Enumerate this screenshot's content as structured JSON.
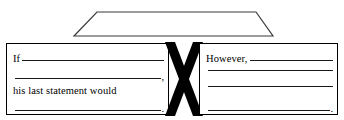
{
  "diagram": {
    "shapes": {
      "top_banner": {
        "name": "trapezoid",
        "stroke_color": "#3a3a3a",
        "fill_color": "#ffffff",
        "text": ""
      },
      "center_marker": {
        "name": "bold-x",
        "color": "#000000"
      }
    },
    "left_box": {
      "border_color": "#000000",
      "lines": [
        {
          "prompt": "If",
          "rule": true,
          "punct": ""
        },
        {
          "prompt": "",
          "rule": true,
          "punct": ","
        },
        {
          "prompt": "his last statement would",
          "rule": false,
          "punct": ""
        },
        {
          "prompt": "",
          "rule": true,
          "punct": "."
        }
      ]
    },
    "right_box": {
      "border_color": "#000000",
      "lines": [
        {
          "prompt": "However,",
          "rule": true,
          "punct": ""
        },
        {
          "prompt": "",
          "rule": true,
          "punct": ""
        },
        {
          "prompt": "",
          "rule": true,
          "punct": ""
        },
        {
          "prompt": "",
          "rule": true,
          "punct": "."
        }
      ]
    }
  }
}
